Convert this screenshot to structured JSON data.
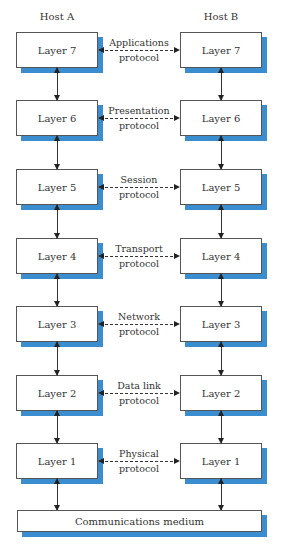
{
  "hosts": {
    "a": "Host A",
    "b": "Host B"
  },
  "layers": [
    {
      "name": "Layer 7",
      "protocol_line1": "Applications",
      "protocol_line2": "protocol"
    },
    {
      "name": "Layer 6",
      "protocol_line1": "Presentation",
      "protocol_line2": "protocol"
    },
    {
      "name": "Layer 5",
      "protocol_line1": "Session",
      "protocol_line2": "protocol"
    },
    {
      "name": "Layer 4",
      "protocol_line1": "Transport",
      "protocol_line2": "protocol"
    },
    {
      "name": "Layer 3",
      "protocol_line1": "Network",
      "protocol_line2": "protocol"
    },
    {
      "name": "Layer 2",
      "protocol_line1": "Data link",
      "protocol_line2": "protocol"
    },
    {
      "name": "Layer 1",
      "protocol_line1": "Physical",
      "protocol_line2": "protocol"
    }
  ],
  "medium": "Communications medium",
  "colors": {
    "shadow": "#3a8ed0",
    "border": "#555555"
  }
}
